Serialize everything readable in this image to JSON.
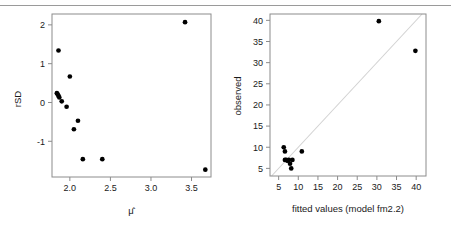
{
  "figure": {
    "background": "#ffffff",
    "foreground": "#1a1a1a",
    "rule_color": "#9a9a9a",
    "point_color": "#000000",
    "refline_color": "#d2d2d2",
    "frame_color": "#8c8c8c",
    "panel_count": 2
  },
  "chart_data": [
    {
      "type": "scatter",
      "id": "left-panel",
      "title": "",
      "xlabel": "μ̂",
      "ylabel": "rSD",
      "xlim": [
        1.78,
        3.74
      ],
      "ylim": [
        -1.92,
        2.28
      ],
      "xticks": [
        2.0,
        2.5,
        3.0,
        3.5
      ],
      "xticklabels": [
        "2.0",
        "2.5",
        "3.0",
        "3.5"
      ],
      "yticks": [
        -1,
        0,
        1,
        2
      ],
      "yticklabels": [
        "-1",
        "0",
        "1",
        "2"
      ],
      "grid": false,
      "legend": null,
      "frame": "box",
      "x": [
        1.86,
        1.84,
        1.85,
        1.86,
        1.87,
        1.9,
        1.96,
        2.0,
        2.05,
        2.1,
        2.16,
        2.4,
        3.42,
        3.67
      ],
      "y": [
        1.34,
        0.24,
        0.21,
        0.17,
        0.13,
        0.03,
        -0.11,
        0.67,
        -0.69,
        -0.47,
        -1.46,
        -1.46,
        2.07,
        -1.73
      ]
    },
    {
      "type": "scatter",
      "id": "right-panel",
      "title": "",
      "xlabel": "fitted values (model fm2.2)",
      "ylabel": "observed",
      "xlim": [
        2.8,
        42.5
      ],
      "ylim": [
        3.2,
        41.5
      ],
      "xticks": [
        5,
        10,
        15,
        20,
        25,
        30,
        35,
        40
      ],
      "xticklabels": [
        "5",
        "10",
        "15",
        "20",
        "25",
        "30",
        "35",
        "40"
      ],
      "yticks": [
        5,
        10,
        15,
        20,
        25,
        30,
        35,
        40
      ],
      "yticklabels": [
        "5",
        "10",
        "15",
        "20",
        "25",
        "30",
        "35",
        "40"
      ],
      "grid": false,
      "legend": null,
      "frame": "box",
      "reference_line": {
        "type": "identity",
        "slope": 1,
        "intercept": 0,
        "color": "#d2d2d2"
      },
      "x": [
        6.3,
        6.6,
        6.6,
        6.9,
        7.1,
        7.3,
        7.6,
        7.9,
        8.2,
        8.5,
        10.9,
        30.5,
        39.8
      ],
      "y": [
        10.0,
        9.0,
        7.0,
        7.0,
        6.9,
        6.8,
        7.0,
        6.1,
        5.0,
        7.0,
        9.0,
        39.8,
        32.8
      ]
    }
  ]
}
